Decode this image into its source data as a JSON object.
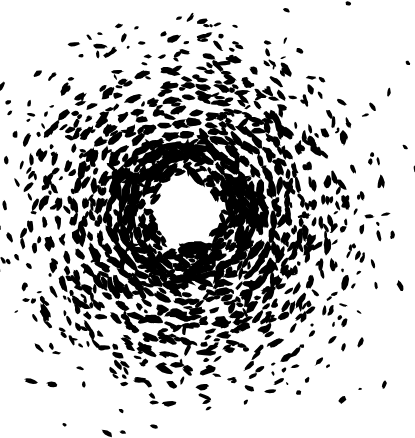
{
  "image": {
    "kind": "x-ray-laue-diffraction-pattern",
    "title": "Laue X-ray diffraction pattern",
    "width": 415,
    "height": 438,
    "background_color": "#ffffff",
    "spot_color": "#000000"
  },
  "chart_data": {
    "type": "scatter",
    "title": "Laue X-ray diffraction pattern",
    "subtitle": "",
    "xlabel": "",
    "ylabel": "",
    "xlim": [
      0,
      415
    ],
    "ylim": [
      0,
      438
    ],
    "grid": false,
    "legend": "none",
    "symmetry_order": 6,
    "center": {
      "x": 187,
      "y": 212
    },
    "beamstop_void_radius": 30,
    "pattern_outer_radius": 215,
    "background_color": "#ffffff",
    "spot_color": "#000000",
    "annotations": [],
    "rings": [
      {
        "name": "ring-1",
        "radius": 46,
        "spots_per_sector": 3,
        "size": 3.1,
        "elongation": 1.7,
        "jitter": 3.0,
        "density": 0.95
      },
      {
        "name": "ring-2",
        "radius": 56,
        "spots_per_sector": 4,
        "size": 3.4,
        "elongation": 1.9,
        "jitter": 3.2,
        "density": 0.95
      },
      {
        "name": "ring-3",
        "radius": 66,
        "spots_per_sector": 5,
        "size": 3.6,
        "elongation": 2.0,
        "jitter": 3.4,
        "density": 0.93
      },
      {
        "name": "ring-4",
        "radius": 77,
        "spots_per_sector": 5,
        "size": 3.5,
        "elongation": 1.9,
        "jitter": 3.6,
        "density": 0.93
      },
      {
        "name": "ring-5",
        "radius": 89,
        "spots_per_sector": 6,
        "size": 3.4,
        "elongation": 1.9,
        "jitter": 3.8,
        "density": 0.9
      },
      {
        "name": "ring-6",
        "radius": 101,
        "spots_per_sector": 6,
        "size": 3.3,
        "elongation": 1.8,
        "jitter": 4.0,
        "density": 0.88
      },
      {
        "name": "ring-7",
        "radius": 114,
        "spots_per_sector": 7,
        "size": 3.2,
        "elongation": 1.8,
        "jitter": 4.2,
        "density": 0.86
      },
      {
        "name": "ring-8",
        "radius": 128,
        "spots_per_sector": 7,
        "size": 3.1,
        "elongation": 1.8,
        "jitter": 4.4,
        "density": 0.82
      },
      {
        "name": "ring-9",
        "radius": 143,
        "spots_per_sector": 7,
        "size": 3.0,
        "elongation": 1.8,
        "jitter": 4.6,
        "density": 0.76
      },
      {
        "name": "ring-10",
        "radius": 158,
        "spots_per_sector": 7,
        "size": 2.9,
        "elongation": 1.8,
        "jitter": 4.8,
        "density": 0.68
      },
      {
        "name": "ring-11",
        "radius": 174,
        "spots_per_sector": 6,
        "size": 2.7,
        "elongation": 1.7,
        "jitter": 5.0,
        "density": 0.58
      },
      {
        "name": "ring-12",
        "radius": 190,
        "spots_per_sector": 6,
        "size": 2.5,
        "elongation": 1.6,
        "jitter": 5.2,
        "density": 0.44
      },
      {
        "name": "ring-13",
        "radius": 206,
        "spots_per_sector": 5,
        "size": 2.3,
        "elongation": 1.5,
        "jitter": 5.4,
        "density": 0.3
      }
    ],
    "radial_spokes": {
      "count": 12,
      "start_radius": 40,
      "end_radius": 200,
      "spots_per_spoke": 11,
      "size": 2.8,
      "elongation": 2.2,
      "density": 0.55
    },
    "major_spots": [
      {
        "name": "star-upper-left",
        "x": 130,
        "y": 180,
        "radius": 9.5,
        "type": "star"
      },
      {
        "name": "star-upper-right",
        "x": 240,
        "y": 180,
        "radius": 9.5,
        "type": "star"
      },
      {
        "name": "star-lower-left",
        "x": 131,
        "y": 246,
        "radius": 8.5,
        "type": "star"
      },
      {
        "name": "star-lower-right",
        "x": 240,
        "y": 246,
        "radius": 8.0,
        "type": "star"
      },
      {
        "name": "star-top",
        "x": 186,
        "y": 148,
        "radius": 8.5,
        "type": "star"
      },
      {
        "name": "star-bottom",
        "x": 187,
        "y": 280,
        "radius": 8.5,
        "type": "star"
      },
      {
        "name": "blob-inner-left",
        "x": 153,
        "y": 228,
        "radius": 5.5,
        "type": "blob"
      },
      {
        "name": "blob-inner-right",
        "x": 222,
        "y": 230,
        "radius": 6.0,
        "type": "blob"
      },
      {
        "name": "blob-inner-upper",
        "x": 214,
        "y": 196,
        "radius": 5.0,
        "type": "blob"
      },
      {
        "name": "blob-inner-lower",
        "x": 215,
        "y": 256,
        "radius": 6.5,
        "type": "blob"
      }
    ]
  }
}
